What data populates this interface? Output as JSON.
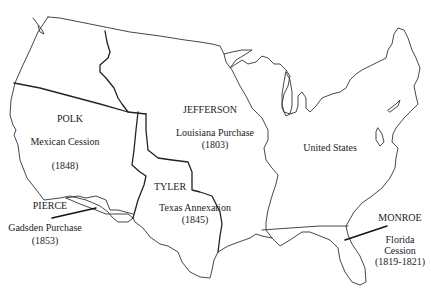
{
  "map": {
    "title": "Territorial Expansion of the United States",
    "regions": [
      {
        "id": "polk",
        "president": "POLK",
        "name": "Mexican Cession",
        "year": "(1848)"
      },
      {
        "id": "jefferson",
        "president": "JEFFERSON",
        "name": "Louisiana Purchase",
        "year": "(1803)"
      },
      {
        "id": "united-states",
        "name": "United States"
      },
      {
        "id": "tyler",
        "president": "TYLER",
        "name": "Texas Annexation",
        "year": "(1845)"
      },
      {
        "id": "pierce",
        "president": "PIERCE",
        "name": "Gadsden Purchase",
        "year": "(1853)"
      },
      {
        "id": "monroe",
        "president": "MONROE",
        "name_line1": "Florida",
        "name_line2": "Cession",
        "year": "(1819-1821)"
      }
    ],
    "colors": {
      "background": "#ffffff",
      "lines": "#333333",
      "text": "#222222"
    }
  }
}
